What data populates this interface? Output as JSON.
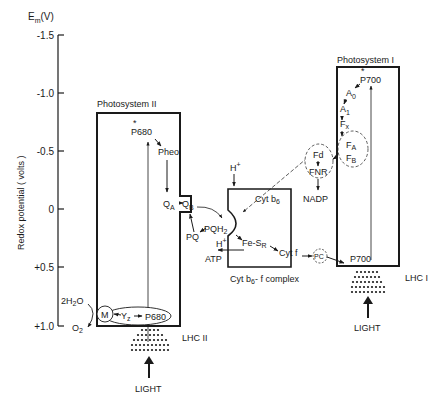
{
  "axis": {
    "unit_label": "E",
    "unit_sub": "m",
    "unit_suffix": "(V)",
    "ylabel": "Redox potential ( volts )",
    "ticks": [
      "-1.5",
      "-1.0",
      "-0.5",
      "0",
      "+0.5",
      "+1.0"
    ]
  },
  "ps2": {
    "title": "Photosystem II",
    "p680_star": "*",
    "p680_excited": "P680",
    "pheo": "Pheo",
    "qa": "Q",
    "qa_sub": "A",
    "qb": "Q",
    "qb_sub": "B",
    "m": "M",
    "yz": "Y",
    "yz_sub": "z",
    "p680": "P680",
    "water": "2H",
    "water_sub": "2",
    "water_o": "O",
    "o2": "O",
    "o2_sub": "2",
    "lhc": "LHC II",
    "light": "LIGHT"
  },
  "cyt": {
    "pq": "PQ",
    "pqh2": "PQH",
    "pqh2_sub": "2",
    "h_top": "H",
    "h_mid": "H",
    "plus": "+",
    "atp": "ATP",
    "fesr": "Fe-S",
    "fesr_sub": "R",
    "cytb6": "Cyt b",
    "cytb6_sub": "6",
    "cytf": "Cyt f",
    "complex_label": "Cyt b",
    "complex_sub": "6",
    "complex_suffix": "- f complex"
  },
  "carriers": {
    "pc": "PC",
    "fd": "Fd",
    "fnr": "FNR",
    "nadp": "NADP"
  },
  "ps1": {
    "title": "Photosystem I",
    "p700_star": "*",
    "p700_excited": "P700",
    "a0": "A",
    "a0_sub": "0",
    "a1": "A",
    "a1_sub": "1",
    "fx": "F",
    "fx_sub": "x",
    "fa": "F",
    "fa_sub": "A",
    "fb": "F",
    "fb_sub": "B",
    "p700": "P700",
    "lhc": "LHC I",
    "light": "LIGHT"
  }
}
